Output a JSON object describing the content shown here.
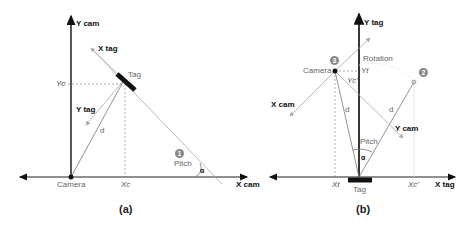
{
  "panel_a": {
    "caption": "(a)",
    "labels": {
      "y_cam": "Y cam",
      "x_cam": "X cam",
      "x_tag": "X tag",
      "y_tag": "Y tag",
      "tag": "Tag",
      "yc": "Yc",
      "xc": "Xc",
      "d": "d",
      "camera": "Camera",
      "pitch": "Pitch",
      "alpha": "α",
      "marker": "1"
    }
  },
  "panel_b": {
    "caption": "(b)",
    "labels": {
      "y_tag": "Y tag",
      "x_tag": "X tag",
      "x_cam": "X cam",
      "y_cam": "Y cam",
      "rotation": "Rotation",
      "camera": "Camera",
      "tag": "Tag",
      "yt": "Yt",
      "yc_prime": "Yc'",
      "xt": "Xt",
      "xc_prime": "Xc'",
      "d_left": "d",
      "d_right": "d",
      "pitch": "Pitch",
      "alpha": "α",
      "marker_2": "2",
      "marker_3": "3"
    }
  }
}
